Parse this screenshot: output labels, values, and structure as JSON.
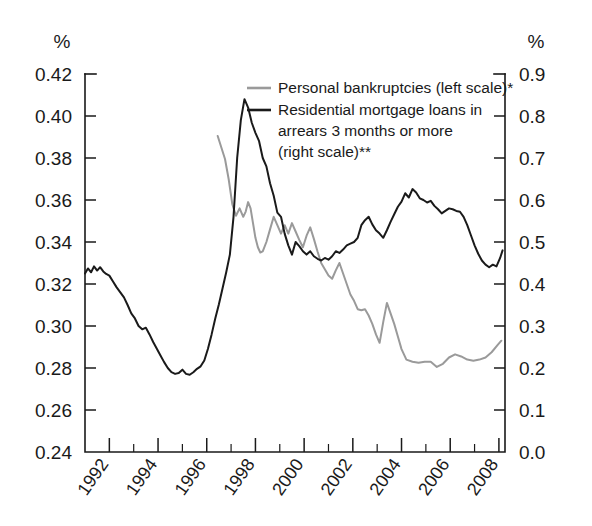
{
  "chart_data": {
    "type": "line",
    "title": "",
    "subtitle": "",
    "xlabel": "",
    "grid": false,
    "legend_position": "inside-top-right",
    "x_axis": {
      "min": 1991.0,
      "max": 2008.25,
      "major_ticks": [
        1992,
        1994,
        1996,
        1998,
        2000,
        2002,
        2004,
        2006,
        2008
      ],
      "minor_ticks": [
        1993,
        1995,
        1997,
        1999,
        2001,
        2003,
        2005,
        2007
      ],
      "tick_labels": [
        "1992",
        "1994",
        "1996",
        "1998",
        "2000",
        "2002",
        "2004",
        "2006",
        "2008"
      ]
    },
    "left_axis": {
      "unit": "%",
      "min": 0.24,
      "max": 0.42,
      "tick_labels": [
        "0.42",
        "0.40",
        "0.38",
        "0.36",
        "0.34",
        "0.32",
        "0.30",
        "0.28",
        "0.26",
        "0.24"
      ],
      "tick_values": [
        0.42,
        0.4,
        0.38,
        0.36,
        0.34,
        0.32,
        0.3,
        0.28,
        0.26,
        0.24
      ]
    },
    "right_axis": {
      "unit": "%",
      "min": 0.0,
      "max": 0.9,
      "tick_labels": [
        "0.9",
        "0.8",
        "0.7",
        "0.6",
        "0.5",
        "0.4",
        "0.3",
        "0.2",
        "0.1",
        "0.0"
      ],
      "tick_values": [
        0.9,
        0.8,
        0.7,
        0.6,
        0.5,
        0.4,
        0.3,
        0.2,
        0.1,
        0.0
      ]
    },
    "series": [
      {
        "name": "Personal bankruptcies (left scale)*",
        "legend_label": "Personal bankruptcies (left scale)*",
        "axis": "left",
        "color": "#9a9a9a",
        "x": [
          1996.45,
          1996.6,
          1996.75,
          1996.9,
          1997.05,
          1997.2,
          1997.35,
          1997.5,
          1997.6,
          1997.7,
          1997.8,
          1997.9,
          1998.0,
          1998.1,
          1998.2,
          1998.3,
          1998.45,
          1998.6,
          1998.75,
          1998.9,
          1999.05,
          1999.2,
          1999.35,
          1999.5,
          1999.65,
          1999.8,
          1999.95,
          2000.1,
          2000.25,
          2000.4,
          2000.55,
          2000.7,
          2000.85,
          2001.0,
          2001.15,
          2001.3,
          2001.45,
          2001.6,
          2001.75,
          2001.9,
          2002.05,
          2002.2,
          2002.35,
          2002.5,
          2002.65,
          2002.8,
          2002.95,
          2003.1,
          2003.25,
          2003.4,
          2003.55,
          2003.7,
          2003.85,
          2004.0,
          2004.2,
          2004.45,
          2004.7,
          2004.95,
          2005.2,
          2005.45,
          2005.7,
          2005.95,
          2006.2,
          2006.45,
          2006.7,
          2006.95,
          2007.2,
          2007.45,
          2007.7,
          2007.95,
          2008.1
        ],
        "y": [
          0.3905,
          0.385,
          0.3795,
          0.37,
          0.358,
          0.3525,
          0.356,
          0.352,
          0.3545,
          0.359,
          0.356,
          0.349,
          0.342,
          0.3375,
          0.335,
          0.3355,
          0.34,
          0.346,
          0.352,
          0.348,
          0.344,
          0.348,
          0.344,
          0.349,
          0.345,
          0.341,
          0.3375,
          0.343,
          0.347,
          0.3415,
          0.3355,
          0.33,
          0.327,
          0.324,
          0.3225,
          0.3265,
          0.33,
          0.325,
          0.32,
          0.315,
          0.312,
          0.308,
          0.3075,
          0.308,
          0.305,
          0.301,
          0.296,
          0.292,
          0.302,
          0.311,
          0.306,
          0.301,
          0.295,
          0.289,
          0.284,
          0.283,
          0.2825,
          0.283,
          0.283,
          0.2805,
          0.282,
          0.285,
          0.2865,
          0.2855,
          0.284,
          0.2835,
          0.284,
          0.285,
          0.2875,
          0.291,
          0.293
        ]
      },
      {
        "name": "Residential mortgage loans in arrears 3 months or more (right scale)**",
        "legend_label_lines": [
          "Residential mortgage loans in",
          "arrears 3 months or more",
          "(right scale)**"
        ],
        "axis": "right",
        "color": "#1a1a1a",
        "x": [
          1991.0,
          1991.12,
          1991.25,
          1991.37,
          1991.5,
          1991.62,
          1991.75,
          1991.87,
          1992.0,
          1992.15,
          1992.3,
          1992.45,
          1992.6,
          1992.75,
          1992.9,
          1993.05,
          1993.2,
          1993.35,
          1993.5,
          1993.65,
          1993.8,
          1993.95,
          1994.1,
          1994.25,
          1994.4,
          1994.55,
          1994.7,
          1994.85,
          1995.0,
          1995.15,
          1995.3,
          1995.45,
          1995.6,
          1995.75,
          1995.9,
          1996.05,
          1996.2,
          1996.35,
          1996.5,
          1996.65,
          1996.8,
          1996.95,
          1997.1,
          1997.25,
          1997.4,
          1997.55,
          1997.7,
          1997.85,
          1998.0,
          1998.15,
          1998.3,
          1998.45,
          1998.6,
          1998.75,
          1998.9,
          1999.05,
          1999.2,
          1999.35,
          1999.5,
          1999.65,
          1999.8,
          1999.95,
          2000.1,
          2000.25,
          2000.4,
          2000.55,
          2000.7,
          2000.85,
          2001.0,
          2001.15,
          2001.3,
          2001.45,
          2001.6,
          2001.75,
          2001.9,
          2002.05,
          2002.2,
          2002.35,
          2002.5,
          2002.65,
          2002.8,
          2002.95,
          2003.1,
          2003.25,
          2003.4,
          2003.55,
          2003.7,
          2003.85,
          2004.0,
          2004.15,
          2004.3,
          2004.45,
          2004.6,
          2004.75,
          2004.9,
          2005.05,
          2005.2,
          2005.35,
          2005.5,
          2005.65,
          2005.8,
          2005.95,
          2006.1,
          2006.25,
          2006.4,
          2006.55,
          2006.7,
          2006.85,
          2007.0,
          2007.15,
          2007.3,
          2007.45,
          2007.6,
          2007.75,
          2007.9,
          2008.05,
          2008.15
        ],
        "y": [
          0.425,
          0.437,
          0.428,
          0.442,
          0.432,
          0.44,
          0.43,
          0.424,
          0.42,
          0.406,
          0.392,
          0.38,
          0.368,
          0.35,
          0.33,
          0.318,
          0.3,
          0.292,
          0.296,
          0.28,
          0.262,
          0.246,
          0.23,
          0.214,
          0.2,
          0.19,
          0.186,
          0.188,
          0.196,
          0.186,
          0.184,
          0.19,
          0.198,
          0.204,
          0.218,
          0.246,
          0.28,
          0.318,
          0.352,
          0.39,
          0.428,
          0.47,
          0.56,
          0.7,
          0.79,
          0.84,
          0.82,
          0.784,
          0.76,
          0.74,
          0.7,
          0.68,
          0.64,
          0.61,
          0.57,
          0.56,
          0.52,
          0.492,
          0.47,
          0.5,
          0.49,
          0.478,
          0.47,
          0.478,
          0.466,
          0.46,
          0.456,
          0.462,
          0.458,
          0.466,
          0.478,
          0.474,
          0.482,
          0.492,
          0.496,
          0.5,
          0.51,
          0.54,
          0.552,
          0.56,
          0.542,
          0.528,
          0.52,
          0.51,
          0.528,
          0.548,
          0.566,
          0.584,
          0.596,
          0.616,
          0.606,
          0.626,
          0.618,
          0.604,
          0.6,
          0.594,
          0.598,
          0.586,
          0.578,
          0.568,
          0.574,
          0.58,
          0.578,
          0.574,
          0.572,
          0.56,
          0.54,
          0.516,
          0.492,
          0.472,
          0.456,
          0.446,
          0.44,
          0.446,
          0.442,
          0.462,
          0.48
        ]
      }
    ]
  },
  "legend": {
    "items": [
      {
        "label": "Personal bankruptcies (left scale)*",
        "color": "#9a9a9a"
      },
      {
        "label": "Residential mortgage loans in",
        "color": "#1a1a1a"
      },
      {
        "label": "arrears 3 months or more",
        "color": "#1a1a1a"
      },
      {
        "label": "(right scale)**",
        "color": "#1a1a1a"
      }
    ]
  },
  "axis_units": {
    "left": "%",
    "right": "%"
  }
}
